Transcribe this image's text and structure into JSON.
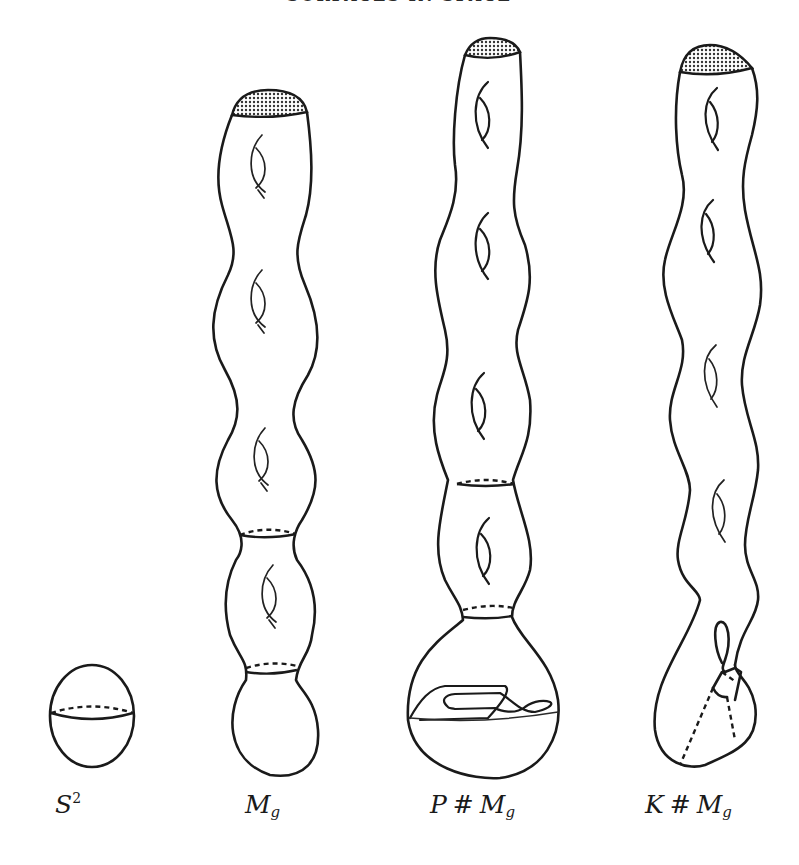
{
  "page": {
    "running_header": "SURFACES IN SPACE",
    "ink_color": "#1a1a1a",
    "background": "#ffffff"
  },
  "figures": [
    {
      "id": "sphere",
      "label_main": "S",
      "label_sup": "2",
      "label_sub": "",
      "prefix": "",
      "description": "sphere with dashed/solid equator"
    },
    {
      "id": "mg",
      "label_main": "M",
      "label_sub": "g",
      "prefix": "",
      "description": "tube with shaded boundary cap, 4 handles, two meridian circles, rounded bottom"
    },
    {
      "id": "p-sum",
      "label_prefix": "P",
      "label_op": "#",
      "label_main": "M",
      "label_sub": "g",
      "description": "tube with shaded cap, 4 handles, two meridian circles, bulb with crosscap curve"
    },
    {
      "id": "k-sum",
      "label_prefix": "K",
      "label_op": "#",
      "label_main": "M",
      "label_sub": "g",
      "description": "tube with shaded cap, 5 handles, Klein bottle self-intersection bulb"
    }
  ]
}
